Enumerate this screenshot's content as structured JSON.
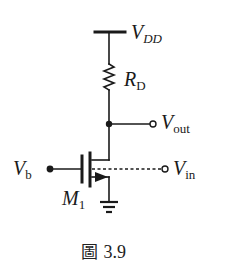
{
  "figure": {
    "caption_prefix": "圖",
    "caption_number": "3.9"
  },
  "labels": {
    "vdd": {
      "main": "V",
      "sub": "DD"
    },
    "rd": {
      "main": "R",
      "sub": "D"
    },
    "vout": {
      "main": "V",
      "sub": "out"
    },
    "vb": {
      "main": "V",
      "sub": "b"
    },
    "vin": {
      "main": "V",
      "sub": "in"
    },
    "m1": {
      "main": "M",
      "sub": "1"
    }
  },
  "colors": {
    "wire": "#1a1a1a",
    "background": "#ffffff"
  }
}
